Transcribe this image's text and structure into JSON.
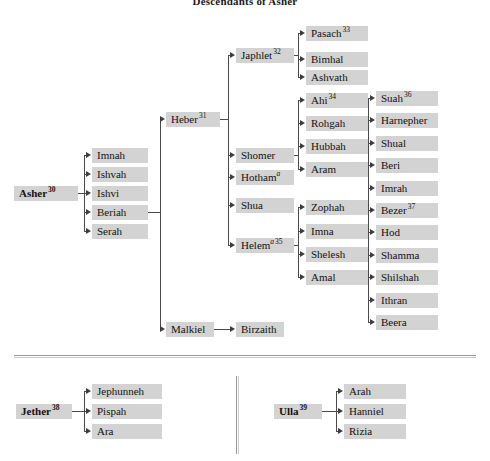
{
  "page": {
    "title": "Descendants of Asher"
  },
  "tree": {
    "root": {
      "name": "Asher",
      "verse": "30"
    },
    "asher_children": [
      {
        "name": "Imnah"
      },
      {
        "name": "Ishvah"
      },
      {
        "name": "Ishvi"
      },
      {
        "name": "Beriah"
      },
      {
        "name": "Serah"
      }
    ],
    "beriah_children": [
      {
        "name": "Heber",
        "verse": "31"
      },
      {
        "name": "Malkiel"
      }
    ],
    "malkiel_children": [
      {
        "name": "Birzaith"
      }
    ],
    "heber_children": [
      {
        "name": "Japhlet",
        "verse": "32"
      },
      {
        "name": "Shomer"
      },
      {
        "name": "Hotham",
        "note": "a"
      },
      {
        "name": "Shua"
      },
      {
        "name": "Helem",
        "note": "a",
        "verse": "35"
      }
    ],
    "japhlet_children": [
      {
        "name": "Pasach",
        "verse": "33"
      },
      {
        "name": "Bimhal"
      },
      {
        "name": "Ashvath"
      }
    ],
    "shomer_children": [
      {
        "name": "Ahi",
        "verse": "34"
      },
      {
        "name": "Rohgah"
      },
      {
        "name": "Hubbah"
      },
      {
        "name": "Aram"
      }
    ],
    "helem_children": [
      {
        "name": "Zophah"
      },
      {
        "name": "Imna"
      },
      {
        "name": "Shelesh"
      },
      {
        "name": "Amal"
      }
    ],
    "zophah_children": [
      {
        "name": "Suah",
        "verse": "36"
      },
      {
        "name": "Harnepher"
      },
      {
        "name": "Shual"
      },
      {
        "name": "Beri"
      },
      {
        "name": "Imrah"
      },
      {
        "name": "Bezer",
        "verse": "37"
      },
      {
        "name": "Hod"
      },
      {
        "name": "Shamma"
      },
      {
        "name": "Shilshah"
      },
      {
        "name": "Ithran"
      },
      {
        "name": "Beera"
      }
    ]
  },
  "bottom_left": {
    "root": {
      "name": "Jether",
      "verse": "38"
    },
    "children": [
      {
        "name": "Jephunneh"
      },
      {
        "name": "Pispah"
      },
      {
        "name": "Ara"
      }
    ]
  },
  "bottom_right": {
    "root": {
      "name": "Ulla",
      "verse": "39"
    },
    "children": [
      {
        "name": "Arah"
      },
      {
        "name": "Hanniel"
      },
      {
        "name": "Rizia"
      }
    ]
  },
  "style": {
    "box_fill": "#d3d3d3",
    "line_color": "#4a4a4a",
    "text_color": "#15120f",
    "background": "#ffffff"
  }
}
